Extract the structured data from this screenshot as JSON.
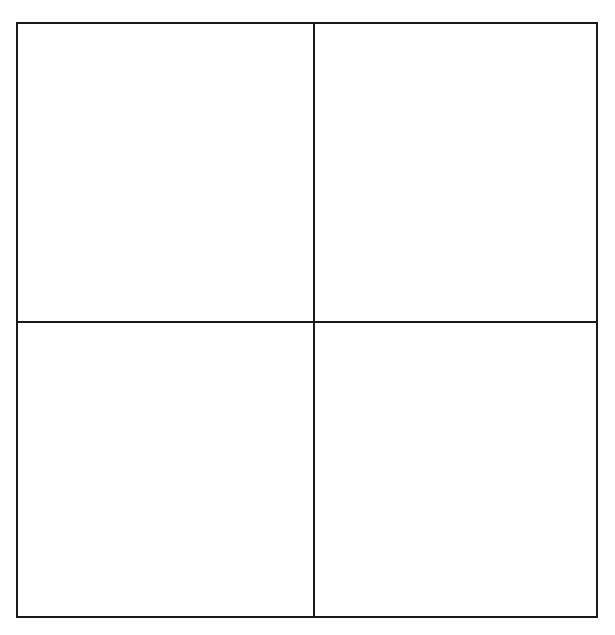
{
  "document": {
    "type": "blank-four-quadrant-grid",
    "background_color": "#fefefe",
    "cell_fill_color": "#ffffff",
    "line_color": "#1a1a1a",
    "line_width_px": 2
  },
  "grid": {
    "rows": 2,
    "columns": 2,
    "frame": {
      "left_px": 16,
      "top_px": 22,
      "width_px": 582,
      "height_px": 596
    },
    "dividers": {
      "vertical_x_px": 313,
      "horizontal_y_px": 321
    },
    "quadrants": [
      {
        "position": "top-left",
        "content": ""
      },
      {
        "position": "top-right",
        "content": ""
      },
      {
        "position": "bottom-left",
        "content": ""
      },
      {
        "position": "bottom-right",
        "content": ""
      }
    ]
  }
}
